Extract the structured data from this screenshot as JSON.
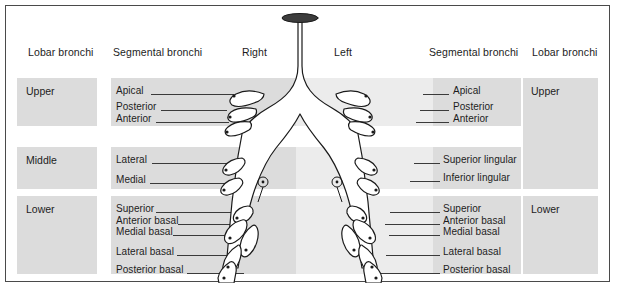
{
  "figure": {
    "colors": {
      "band": "#dcdcdc",
      "border": "#4a4a4a",
      "text": "#1c1c1c",
      "leader": "#3a3a3a",
      "lumen": "#3a3a3a",
      "shade": "#e9e9e9"
    }
  },
  "headers": [
    {
      "label": "Lobar bronchi"
    },
    {
      "label": "Segmental bronchi"
    },
    {
      "label": "Right"
    },
    {
      "label": "Left"
    },
    {
      "label": "Segmental bronchi"
    },
    {
      "label": "Lobar bronchi"
    }
  ],
  "lobes": {
    "left_column": [
      {
        "label": "Upper"
      },
      {
        "label": "Middle"
      },
      {
        "label": "Lower"
      }
    ],
    "right_column": [
      {
        "label": "Upper"
      },
      {
        "label": "Lower"
      }
    ]
  },
  "segments": {
    "right_lung": {
      "upper": [
        {
          "label": "Apical"
        },
        {
          "label": "Posterior"
        },
        {
          "label": "Anterior"
        }
      ],
      "middle": [
        {
          "label": "Lateral"
        },
        {
          "label": "Medial"
        }
      ],
      "lower": [
        {
          "label": "Superior"
        },
        {
          "label": "Anterior basal"
        },
        {
          "label": "Medial basal"
        },
        {
          "label": "Lateral  basal"
        },
        {
          "label": "Posterior  basal"
        }
      ]
    },
    "left_lung": {
      "upper": [
        {
          "label": "Apical"
        },
        {
          "label": "Posterior"
        },
        {
          "label": "Anterior"
        }
      ],
      "lingula": [
        {
          "label": "Superior lingular"
        },
        {
          "label": "Inferior lingular"
        }
      ],
      "lower": [
        {
          "label": "Superior"
        },
        {
          "label": "Anterior basal"
        },
        {
          "label": "Medial basal"
        },
        {
          "label": "Lateral  basal"
        },
        {
          "label": "Posterior  basal"
        }
      ]
    }
  }
}
